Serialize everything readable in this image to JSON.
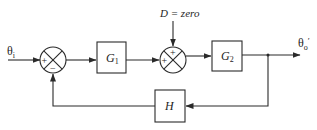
{
  "diagram": {
    "type": "block-diagram",
    "input": {
      "label": "θ",
      "subscript": "i"
    },
    "output": {
      "label": "θ",
      "subscript": "o",
      "prime": "′"
    },
    "disturbance": {
      "label": "D = zero"
    },
    "summing_junctions": [
      {
        "id": "sum1",
        "signs": {
          "left": "+",
          "bottom": "−"
        }
      },
      {
        "id": "sum2",
        "signs": {
          "left": "+",
          "top": "+"
        }
      }
    ],
    "blocks": [
      {
        "id": "G1",
        "label": "G",
        "subscript": "1"
      },
      {
        "id": "G2",
        "label": "G",
        "subscript": "2"
      },
      {
        "id": "H",
        "label": "H",
        "subscript": ""
      }
    ],
    "connections": [
      "θi → sum1 (+)",
      "sum1 → G1",
      "G1 → sum2 (+)",
      "D → sum2 (+)",
      "sum2 → G2",
      "G2 → θo′",
      "θo′ → H (feedback)",
      "H → sum1 (−)"
    ]
  }
}
